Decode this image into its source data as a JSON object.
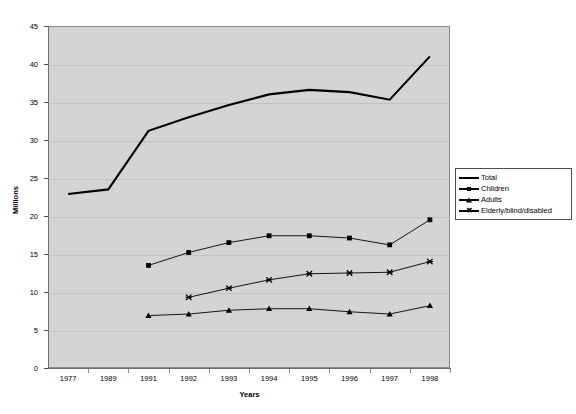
{
  "chart_data": {
    "type": "line",
    "title": "",
    "xlabel": "Years",
    "ylabel": "Millions",
    "ylim": [
      0,
      45
    ],
    "yticks": [
      0,
      5,
      10,
      15,
      20,
      25,
      30,
      35,
      40,
      45
    ],
    "grid": true,
    "legend_position": "right-middle",
    "categories": [
      "1977",
      "1989",
      "1991",
      "1992",
      "1993",
      "1994",
      "1995",
      "1996",
      "1997",
      "1998"
    ],
    "series": [
      {
        "name": "Total",
        "marker": "none",
        "values": [
          22.9,
          23.5,
          31.2,
          33.0,
          34.6,
          36.0,
          36.6,
          36.3,
          35.3,
          41.0
        ]
      },
      {
        "name": "Children",
        "marker": "square",
        "values": [
          null,
          null,
          13.5,
          15.2,
          16.5,
          17.4,
          17.4,
          17.1,
          16.2,
          19.5
        ]
      },
      {
        "name": "Adults",
        "marker": "triangle",
        "values": [
          null,
          null,
          6.9,
          7.1,
          7.6,
          7.8,
          7.8,
          7.4,
          7.1,
          8.2
        ]
      },
      {
        "name": "Elderly/blind/disabled",
        "marker": "x",
        "values": [
          null,
          null,
          null,
          9.3,
          10.5,
          11.6,
          12.4,
          12.5,
          12.6,
          14.0
        ]
      }
    ]
  },
  "axes": {
    "y_title": "Millions",
    "x_title": "Years",
    "y_tick_labels": [
      "45",
      "40",
      "35",
      "30",
      "25",
      "20",
      "15",
      "10",
      "5",
      "0"
    ],
    "x_tick_labels": [
      "1977",
      "1989",
      "1991",
      "1992",
      "1993",
      "1994",
      "1995",
      "1996",
      "1997",
      "1998"
    ]
  },
  "legend": {
    "entries": [
      {
        "label": "Total",
        "marker": "line-icon"
      },
      {
        "label": "Children",
        "marker": "square-marker-icon"
      },
      {
        "label": "Adults",
        "marker": "triangle-marker-icon"
      },
      {
        "label": "Elderly/blind/disabled",
        "marker": "x-marker-icon"
      }
    ]
  },
  "caption": {
    "text": ""
  },
  "colors": {
    "plot_background": "#d4d4d4",
    "series_line": "#000000",
    "gridline": "#c2c2c2",
    "axis": "#6f6f6f"
  }
}
